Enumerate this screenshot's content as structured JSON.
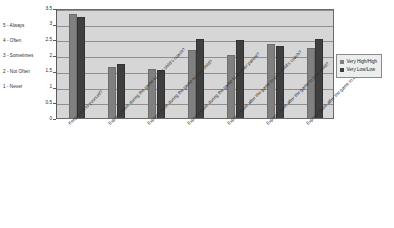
{
  "chart_data": {
    "type": "bar",
    "title": "",
    "xlabel": "",
    "ylabel": "",
    "ylim": [
      0,
      3.5
    ],
    "ytick_labels": [
      "0",
      "0.5",
      "1",
      "1.5",
      "2",
      "2.5",
      "3",
      "3.5"
    ],
    "ytick_values": [
      0,
      0.5,
      1,
      1.5,
      2,
      2.5,
      3,
      3.5
    ],
    "grid": true,
    "legend_position": "right",
    "categories": [
      "Keep them to yourself?",
      "Express them during the game to your child's coach?",
      "Express them during the game to your child?",
      "Express them during the game to another parent?",
      "Express them after the game to your child's coach?",
      "Express them after the game to your child?",
      "Express them after the game to another parent?"
    ],
    "series": [
      {
        "name": "Very High/High",
        "color": "#808080",
        "values": [
          3.3,
          1.62,
          1.57,
          2.15,
          2.0,
          2.35,
          2.24
        ]
      },
      {
        "name": "Very Low/Low",
        "color": "#3f3f3f",
        "values": [
          3.2,
          1.73,
          1.52,
          2.5,
          2.47,
          2.29,
          2.52
        ]
      }
    ],
    "scale_key": [
      "5 - Always",
      "4 - Often",
      "3 - Sometimes",
      "2 - Not Often",
      "1 - Never"
    ]
  },
  "legend": {
    "items": [
      {
        "label": "Very High/High"
      },
      {
        "label": "Very Low/Low"
      }
    ]
  }
}
